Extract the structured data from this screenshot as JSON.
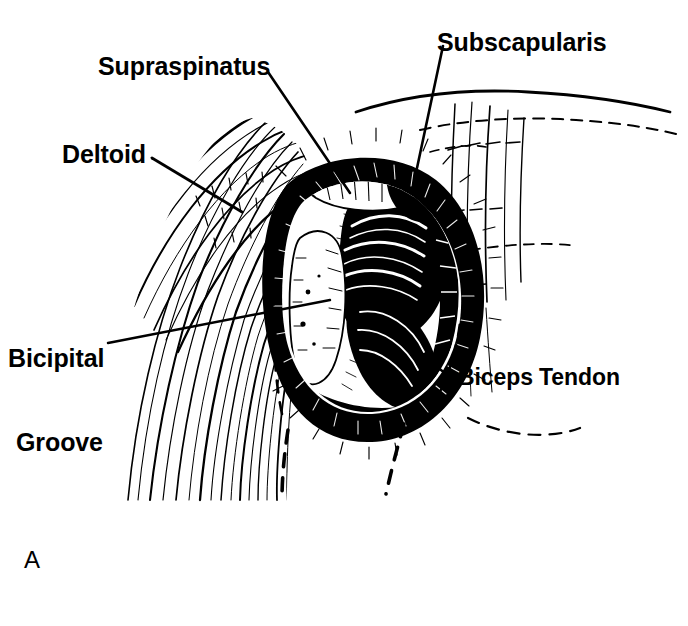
{
  "figure": {
    "kind": "surgical-anatomy-line-drawing",
    "title_letter": "A",
    "region": "Right shoulder, deltopectoral / anterior exposure",
    "style": "black-and-white pen-and-ink stipple and hatch illustration",
    "background_color": "#ffffff",
    "ink_color": "#000000",
    "width": 688,
    "height": 626
  },
  "labels": {
    "supraspinatus": "Supraspinatus",
    "subscapularis": "Subscapularis",
    "deltoid": "Deltoid",
    "bicipital_groove_line1": "Bicipital",
    "bicipital_groove_line2": "Groove",
    "biceps_tendon": "Biceps Tendon"
  },
  "leader_lines": [
    {
      "name": "supraspinatus-leader",
      "from": [
        268,
        72
      ],
      "to": [
        350,
        193
      ]
    },
    {
      "name": "subscapularis-leader",
      "from": [
        443,
        46
      ],
      "to": [
        417,
        168
      ]
    },
    {
      "name": "deltoid-leader",
      "from": [
        152,
        158
      ],
      "to": [
        242,
        212
      ]
    },
    {
      "name": "bicipital-groove-leader",
      "from": [
        108,
        343
      ],
      "to": [
        330,
        300
      ]
    },
    {
      "name": "biceps-tendon-leader",
      "from": [
        455,
        381
      ],
      "to": [
        418,
        352
      ]
    }
  ],
  "anatomy_parts": [
    {
      "name": "deltoid-muscle",
      "description": "striated muscle fibers sweeping down the left of the field"
    },
    {
      "name": "supraspinatus-tendon",
      "description": "cuff tendon entering the exposure superiorly"
    },
    {
      "name": "subscapularis-muscle",
      "description": "cuff muscle on the medial/superior aspect"
    },
    {
      "name": "bicipital-groove",
      "description": "intertubercular sulcus of the humerus"
    },
    {
      "name": "biceps-tendon",
      "description": "long head of biceps in the groove, inferolateral"
    },
    {
      "name": "humeral-head",
      "description": "rounded head exposed at the center of the wound"
    },
    {
      "name": "wound-retraction-ring",
      "description": "heavy black shaded oval of retracted soft tissue"
    },
    {
      "name": "dashed-skin-outline",
      "description": "dashed contour lines indicating the body surface and planned incision"
    }
  ]
}
